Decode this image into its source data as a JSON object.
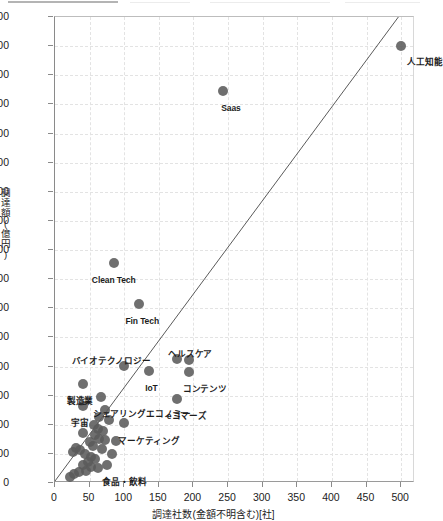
{
  "topbar": {
    "present": true
  },
  "chart_data": {
    "type": "scatter",
    "title": "",
    "xlabel": "調達社数(金額不明含む)[社]",
    "ylabel": "調達額(億円)",
    "xlim": [
      0,
      520
    ],
    "ylim": [
      0,
      1600
    ],
    "xticks": [
      0,
      50,
      100,
      150,
      200,
      250,
      300,
      350,
      400,
      450,
      500
    ],
    "yticks": [
      0,
      100,
      200,
      300,
      400,
      500,
      600,
      700,
      800,
      900,
      1000,
      1100,
      1200,
      1300,
      1400,
      1500,
      1600
    ],
    "grid": true,
    "legend": "none",
    "marker_color": "#5b5b5b",
    "trendline": {
      "type": "line",
      "x0": 0,
      "y0": 0,
      "x1": 505,
      "y1": 1620,
      "color": "#595959"
    },
    "points": [
      {
        "label": "人工知能",
        "x": 500,
        "y": 1500,
        "label_dx": 6,
        "label_dy": 12
      },
      {
        "label": "Saas",
        "x": 243,
        "y": 1345,
        "label_dx": -2,
        "label_dy": 13
      },
      {
        "label": "Clean Tech",
        "x": 85,
        "y": 755,
        "label_dx": -22,
        "label_dy": 13
      },
      {
        "label": "Fin Tech",
        "x": 122,
        "y": 615,
        "label_dx": -14,
        "label_dy": 13
      },
      {
        "label": "バイオテクノロジー",
        "x": 99,
        "y": 403,
        "label_dx": -52,
        "label_dy": -9
      },
      {
        "label": "ヘルスケア",
        "x": 176,
        "y": 425,
        "label_dx": -9,
        "label_dy": -9
      },
      {
        "label": "",
        "x": 193,
        "y": 423,
        "label_dx": 0,
        "label_dy": 0
      },
      {
        "label": "コンテンツ",
        "x": 193,
        "y": 380,
        "label_dx": -6,
        "label_dy": 13
      },
      {
        "label": "IoT",
        "x": 136,
        "y": 383,
        "label_dx": -4,
        "label_dy": 13
      },
      {
        "label": "製造業",
        "x": 40,
        "y": 340,
        "label_dx": -16,
        "label_dy": 13
      },
      {
        "label": "シェアリングエコノミー",
        "x": 66,
        "y": 295,
        "label_dx": -8,
        "label_dy": 13
      },
      {
        "label": "eコマーズ",
        "x": 176,
        "y": 290,
        "label_dx": -10,
        "label_dy": 13
      },
      {
        "label": "宇宙",
        "x": 40,
        "y": 263,
        "label_dx": -12,
        "label_dy": 13
      },
      {
        "label": "マーケティング",
        "x": 100,
        "y": 205,
        "label_dx": -6,
        "label_dy": 14
      },
      {
        "label": "食品・飲料",
        "x": 62,
        "y": 50,
        "label_dx": 4,
        "label_dy": 10
      },
      {
        "label": "",
        "x": 72,
        "y": 250,
        "label_dx": 0,
        "label_dy": 0
      },
      {
        "label": "",
        "x": 63,
        "y": 228,
        "label_dx": 0,
        "label_dy": 0
      },
      {
        "label": "",
        "x": 57,
        "y": 198,
        "label_dx": 0,
        "label_dy": 0
      },
      {
        "label": "",
        "x": 62,
        "y": 186,
        "label_dx": 0,
        "label_dy": 0
      },
      {
        "label": "",
        "x": 70,
        "y": 178,
        "label_dx": 0,
        "label_dy": 0
      },
      {
        "label": "",
        "x": 58,
        "y": 165,
        "label_dx": 0,
        "label_dy": 0
      },
      {
        "label": "",
        "x": 64,
        "y": 152,
        "label_dx": 0,
        "label_dy": 0
      },
      {
        "label": "",
        "x": 72,
        "y": 148,
        "label_dx": 0,
        "label_dy": 0
      },
      {
        "label": "",
        "x": 88,
        "y": 143,
        "label_dx": 0,
        "label_dy": 0
      },
      {
        "label": "",
        "x": 50,
        "y": 140,
        "label_dx": 0,
        "label_dy": 0
      },
      {
        "label": "",
        "x": 55,
        "y": 128,
        "label_dx": 0,
        "label_dy": 0
      },
      {
        "label": "",
        "x": 30,
        "y": 120,
        "label_dx": 0,
        "label_dy": 0
      },
      {
        "label": "",
        "x": 36,
        "y": 112,
        "label_dx": 0,
        "label_dy": 0
      },
      {
        "label": "",
        "x": 26,
        "y": 105,
        "label_dx": 0,
        "label_dy": 0
      },
      {
        "label": "",
        "x": 44,
        "y": 100,
        "label_dx": 0,
        "label_dy": 0
      },
      {
        "label": "",
        "x": 83,
        "y": 98,
        "label_dx": 0,
        "label_dy": 0
      },
      {
        "label": "",
        "x": 52,
        "y": 90,
        "label_dx": 0,
        "label_dy": 0
      },
      {
        "label": "",
        "x": 58,
        "y": 82,
        "label_dx": 0,
        "label_dy": 0
      },
      {
        "label": "",
        "x": 47,
        "y": 72,
        "label_dx": 0,
        "label_dy": 0
      },
      {
        "label": "",
        "x": 40,
        "y": 62,
        "label_dx": 0,
        "label_dy": 0
      },
      {
        "label": "",
        "x": 52,
        "y": 55,
        "label_dx": 0,
        "label_dy": 0
      },
      {
        "label": "",
        "x": 45,
        "y": 42,
        "label_dx": 0,
        "label_dy": 0
      },
      {
        "label": "",
        "x": 34,
        "y": 38,
        "label_dx": 0,
        "label_dy": 0
      },
      {
        "label": "",
        "x": 28,
        "y": 30,
        "label_dx": 0,
        "label_dy": 0
      },
      {
        "label": "",
        "x": 22,
        "y": 22,
        "label_dx": 0,
        "label_dy": 0
      },
      {
        "label": "",
        "x": 78,
        "y": 215,
        "label_dx": 0,
        "label_dy": 0
      },
      {
        "label": "",
        "x": 68,
        "y": 118,
        "label_dx": 0,
        "label_dy": 0
      },
      {
        "label": "",
        "x": 75,
        "y": 62,
        "label_dx": 0,
        "label_dy": 0
      },
      {
        "label": "",
        "x": 40,
        "y": 170,
        "label_dx": 0,
        "label_dy": 0
      }
    ]
  }
}
